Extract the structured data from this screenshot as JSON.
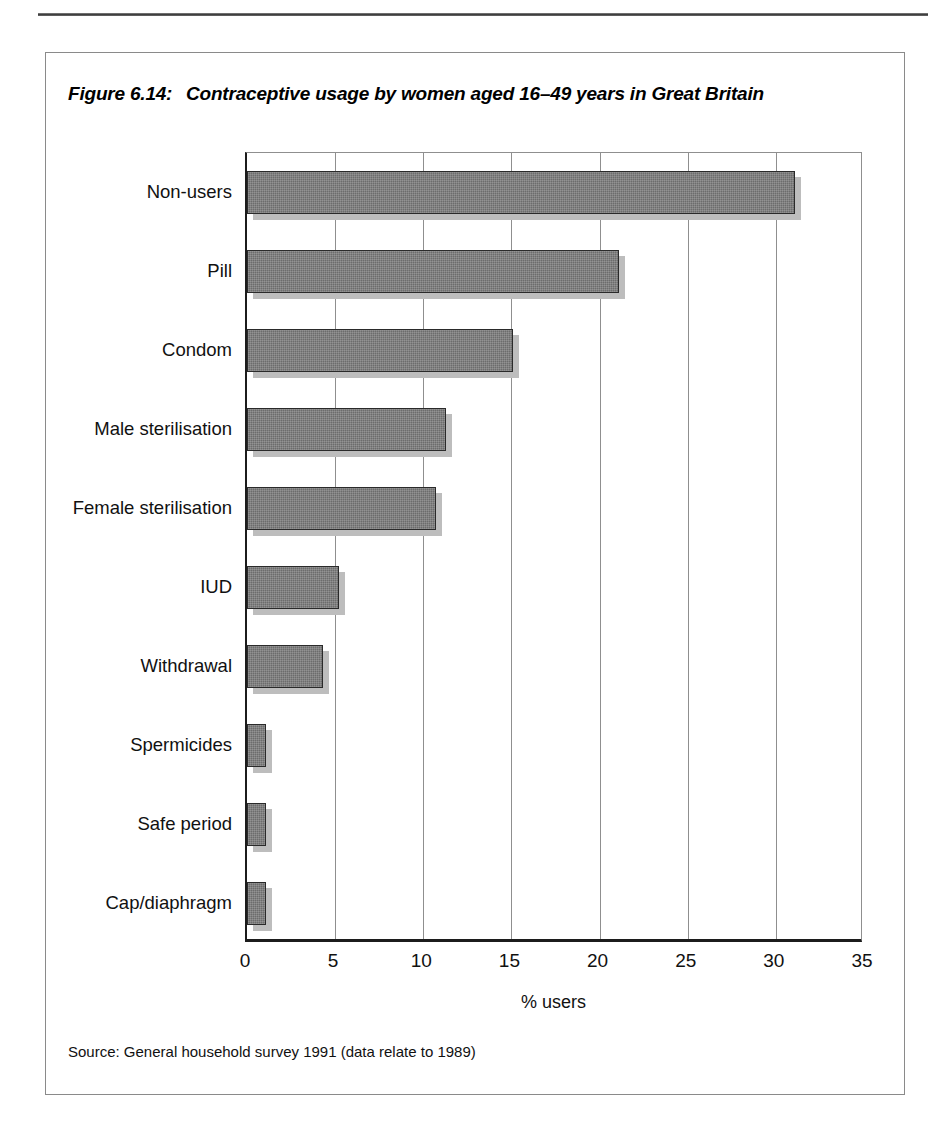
{
  "page": {
    "top_rule": "horizontal-rule",
    "page_number_partial": "162"
  },
  "figure": {
    "number_label": "Figure 6.14:",
    "title": "Contraceptive usage by women aged 16–49 years in Great Britain",
    "source_note": "Source: General household survey 1991 (data relate to 1989)",
    "frame": "figure-border"
  },
  "colors": {
    "bar_fill": "#6c6c6c",
    "bar_border": "#2a2a2a",
    "bar_shadow": "#bdbdbd",
    "axis": "#1c1c1c",
    "gridline": "#8f8f8f",
    "frame": "#8a8a8a"
  },
  "chart_data": {
    "type": "bar",
    "orientation": "horizontal",
    "title": "Contraceptive usage by women aged 16–49 years in Great Britain",
    "xlabel": "% users",
    "ylabel": "",
    "xlim": [
      0,
      35
    ],
    "xticks": [
      0,
      5,
      10,
      15,
      20,
      25,
      30,
      35
    ],
    "xticklabels": [
      "0",
      "5",
      "10",
      "15",
      "20",
      "25",
      "30",
      "35"
    ],
    "grid": "vertical",
    "legend": "none",
    "categories": [
      "Non-users",
      "Pill",
      "Condom",
      "Male sterilisation",
      "Female sterilisation",
      "IUD",
      "Withdrawal",
      "Spermicides",
      "Safe period",
      "Cap/diaphragm"
    ],
    "values": [
      31.1,
      21.1,
      15.1,
      11.3,
      10.7,
      5.2,
      4.3,
      1.1,
      1.1,
      1.1
    ],
    "series": [
      {
        "name": "% users",
        "values": [
          31.1,
          21.1,
          15.1,
          11.3,
          10.7,
          5.2,
          4.3,
          1.1,
          1.1,
          1.1
        ]
      }
    ]
  }
}
